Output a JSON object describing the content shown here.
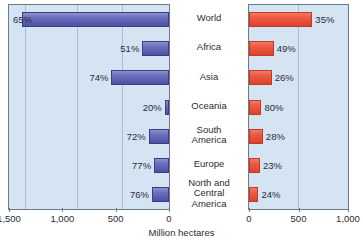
{
  "chart_data": {
    "type": "bar",
    "title": "",
    "subtitle": "",
    "xlabel": "Million hectares",
    "ylabel": "",
    "orientation": "horizontal",
    "layout": "back-to-back paired panels with centered category labels",
    "grid": true,
    "legend": null,
    "categories": [
      "World",
      "Africa",
      "Asia",
      "Oceania",
      "South America",
      "Europe",
      "North and Central America"
    ],
    "category_lines": [
      [
        "World"
      ],
      [
        "Africa"
      ],
      [
        "Asia"
      ],
      [
        "Oceania"
      ],
      [
        "South",
        "America"
      ],
      [
        "Europe"
      ],
      [
        "North and",
        "Central",
        "America"
      ]
    ],
    "panels": [
      {
        "name": "left",
        "color": "#5a5eae",
        "axis_ticks": [
          1500,
          1000,
          500,
          0
        ],
        "axis_tick_labels": [
          "1,500",
          "1,000",
          "500",
          "0"
        ],
        "xlim": [
          1500,
          0
        ],
        "direction": "right-to-left",
        "values": [
          1380,
          250,
          540,
          40,
          190,
          140,
          160
        ],
        "data_labels": [
          "65%",
          "51%",
          "74%",
          "20%",
          "72%",
          "77%",
          "76%"
        ],
        "label_inside": [
          true,
          false,
          false,
          false,
          false,
          false,
          false
        ]
      },
      {
        "name": "right",
        "color": "#e8503c",
        "axis_ticks": [
          0,
          500,
          1000
        ],
        "axis_tick_labels": [
          "0",
          "500",
          "1,000"
        ],
        "xlim": [
          0,
          1000
        ],
        "direction": "left-to-right",
        "values": [
          640,
          250,
          230,
          125,
          140,
          110,
          95
        ],
        "data_labels": [
          "35%",
          "49%",
          "26%",
          "80%",
          "28%",
          "23%",
          "24%"
        ],
        "label_inside": [
          false,
          false,
          false,
          false,
          false,
          false,
          false
        ]
      }
    ],
    "colors": {
      "panel_background": "#d5e4f3",
      "panel_border": "#6d7a8a",
      "gridline": "#a9bdd4",
      "blue_bar": "#5a5eae",
      "red_bar": "#e8503c",
      "text": "#2b2b38",
      "page_background": "#ffffff"
    }
  }
}
